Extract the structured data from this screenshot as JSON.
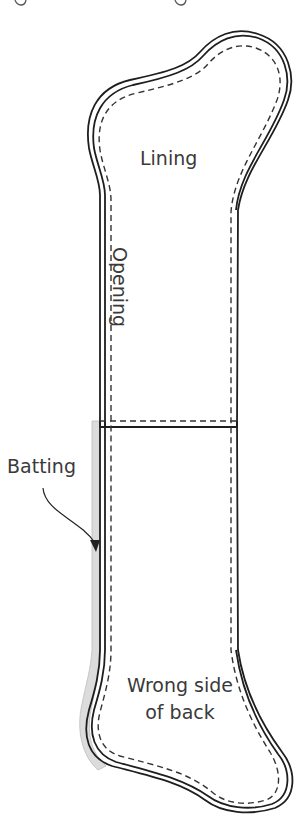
{
  "figure": {
    "type": "sewing-pattern-diagram",
    "colors": {
      "outline": "#1e1e1e",
      "stitch_line": "#333333",
      "batting_fill": "#d9d9d9",
      "label_text": "#3a3a3a",
      "background": "#ffffff"
    },
    "labels": {
      "lining": "Lining",
      "opening": "Opening",
      "batting": "Batting",
      "wrong_side_line1": "Wrong side",
      "wrong_side_line2": "of back"
    },
    "legend_notes": {
      "solid_double_line": "raw edges of layered pieces",
      "dashed_line": "stitching line",
      "horizontal_seam": "lining fold / overlap line"
    }
  }
}
